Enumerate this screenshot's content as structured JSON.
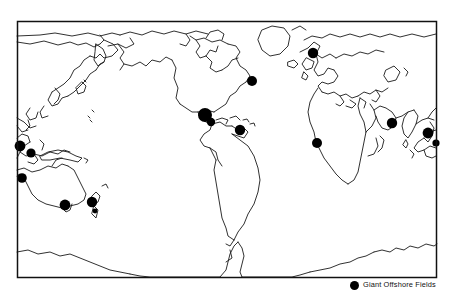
{
  "figure": {
    "kind": "world-map",
    "projection_note": "Pacific-centered world outline map",
    "frame": {
      "x": 17,
      "y": 21,
      "width": 420,
      "height": 257
    },
    "background_color": "#ffffff",
    "outline_color": "#1a1a1a",
    "marker_color": "#000000"
  },
  "legend": {
    "marker_icon": "filled-circle-icon",
    "label": "Giant Offshore Fields",
    "marker_color": "#000000"
  },
  "chart_data": {
    "type": "scatter",
    "title": "Giant Offshore Fields",
    "xlabel": "",
    "ylabel": "",
    "legend": [
      "Giant Offshore Fields"
    ],
    "marker_shape": "circle",
    "marker_color": "#000000",
    "points": [
      {
        "name": "north-sea",
        "x": 313,
        "y": 53,
        "r": 5.2
      },
      {
        "name": "us-east-coast-atlantic",
        "x": 252,
        "y": 81,
        "r": 5.0
      },
      {
        "name": "gulf-of-mexico",
        "x": 205,
        "y": 115,
        "r": 7.0
      },
      {
        "name": "gulf-of-mexico-campeche",
        "x": 211,
        "y": 122,
        "r": 4.2
      },
      {
        "name": "caribbean-trinidad",
        "x": 240,
        "y": 130,
        "r": 5.2
      },
      {
        "name": "west-africa-nigeria",
        "x": 317,
        "y": 143,
        "r": 5.0
      },
      {
        "name": "persian-gulf",
        "x": 392,
        "y": 123,
        "r": 5.2
      },
      {
        "name": "south-china-sea",
        "x": 428,
        "y": 133,
        "r": 5.4
      },
      {
        "name": "borneo-east",
        "x": 436,
        "y": 143,
        "r": 3.6
      },
      {
        "name": "indonesia-west",
        "x": 20,
        "y": 146,
        "r": 5.4
      },
      {
        "name": "java-sea",
        "x": 31,
        "y": 153,
        "r": 4.6
      },
      {
        "name": "australia-northwest-shelf",
        "x": 22,
        "y": 178,
        "r": 4.8
      },
      {
        "name": "australia-bass-strait",
        "x": 65,
        "y": 205,
        "r": 5.4
      },
      {
        "name": "new-zealand-taranaki",
        "x": 92,
        "y": 202,
        "r": 5.2
      },
      {
        "name": "new-zealand-south",
        "x": 95,
        "y": 211,
        "r": 2.4
      }
    ],
    "point_count": 15
  }
}
